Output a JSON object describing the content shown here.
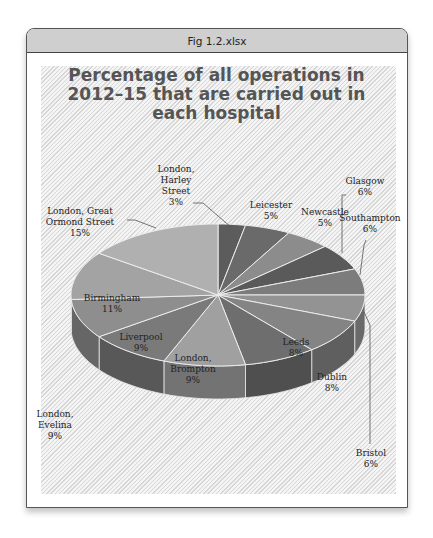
{
  "window": {
    "title": "Fig 1.2.xlsx"
  },
  "chart_data": {
    "type": "pie",
    "style": "3d-exploded-none",
    "title": "Percentage of all operations in 2012–15 that are carried out in each hospital",
    "title_lines": [
      "Percentage of all operations in",
      "2012–15 that are carried out in",
      "each hospital"
    ],
    "categories": [
      "London, Harley Street",
      "Leicester",
      "Newcastle",
      "Glasgow",
      "Southampton",
      "Bristol",
      "Dublin",
      "Leeds",
      "London, Brompton",
      "Liverpool",
      "London, Evelina",
      "Birmingham",
      "London, Great Ormond Street"
    ],
    "values": [
      3,
      5,
      5,
      6,
      6,
      6,
      8,
      8,
      9,
      9,
      9,
      11,
      15
    ],
    "unit": "%",
    "start_angle_deg": 0,
    "direction": "clockwise",
    "legend": "none (data labels)",
    "labels": [
      {
        "lines": [
          "London,",
          "Harley",
          "Street",
          "3%"
        ]
      },
      {
        "lines": [
          "Leicester",
          "5%"
        ]
      },
      {
        "lines": [
          "Newcastle",
          "5%"
        ]
      },
      {
        "lines": [
          "Glasgow",
          "6%"
        ]
      },
      {
        "lines": [
          "Southampton",
          "6%"
        ]
      },
      {
        "lines": [
          "Bristol",
          "6%"
        ]
      },
      {
        "lines": [
          "Dublin",
          "8%"
        ]
      },
      {
        "lines": [
          "Leeds",
          "8%"
        ]
      },
      {
        "lines": [
          "London,",
          "Brompton",
          "9%"
        ]
      },
      {
        "lines": [
          "Liverpool",
          "9%"
        ]
      },
      {
        "lines": [
          "London,",
          "Evelina",
          "9%"
        ]
      },
      {
        "lines": [
          "Birmingham",
          "11%"
        ]
      },
      {
        "lines": [
          "London, Great",
          "Ormond Street",
          "15%"
        ]
      }
    ],
    "colors": [
      "#5c5c5c",
      "#6a6a6a",
      "#8c8c8c",
      "#5a5a5a",
      "#7c7c7c",
      "#939393",
      "#848484",
      "#6e6e6e",
      "#a0a0a0",
      "#7a7a7a",
      "#8e8e8e",
      "#a3a3a3",
      "#b0b0b0"
    ]
  }
}
